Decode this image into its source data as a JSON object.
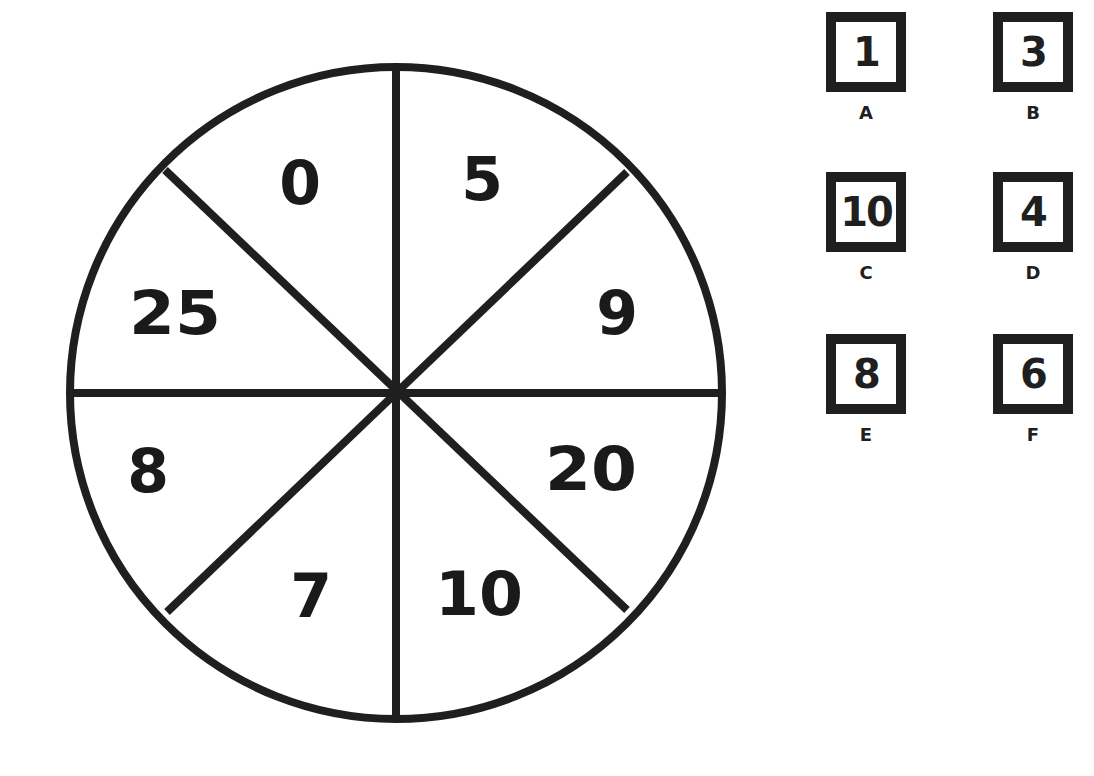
{
  "spinner": {
    "segments": [
      {
        "position": "top-left",
        "value": "0"
      },
      {
        "position": "top-right",
        "value": "5"
      },
      {
        "position": "right-upper",
        "value": "9"
      },
      {
        "position": "right-lower",
        "value": "20"
      },
      {
        "position": "bottom-right",
        "value": "10"
      },
      {
        "position": "bottom-left",
        "value": "7"
      },
      {
        "position": "left-lower",
        "value": "8"
      },
      {
        "position": "left-upper",
        "value": "25"
      }
    ]
  },
  "cards": [
    {
      "value": "1",
      "letter": "A"
    },
    {
      "value": "3",
      "letter": "B"
    },
    {
      "value": "10",
      "letter": "C"
    },
    {
      "value": "4",
      "letter": "D"
    },
    {
      "value": "8",
      "letter": "E"
    },
    {
      "value": "6",
      "letter": "F"
    }
  ],
  "colors": {
    "ink": "#1f1f1f",
    "background": "#ffffff"
  }
}
